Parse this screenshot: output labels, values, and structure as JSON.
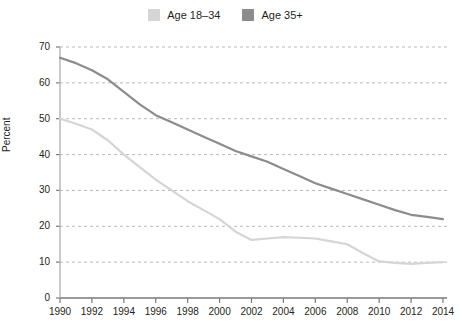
{
  "chart_data": {
    "type": "line",
    "title": "",
    "subtitle": "",
    "xlabel": "",
    "ylabel": "Percent",
    "xlim": [
      1990,
      2014
    ],
    "ylim": [
      0,
      70
    ],
    "grid": "horizontal-dashed",
    "legend_position": "top-center",
    "x": [
      1990,
      1991,
      1992,
      1993,
      1994,
      1995,
      1996,
      1997,
      1998,
      1999,
      2000,
      2001,
      2002,
      2003,
      2004,
      2005,
      2006,
      2007,
      2008,
      2009,
      2010,
      2011,
      2012,
      2013,
      2014
    ],
    "xticks": [
      1990,
      1992,
      1994,
      1996,
      1998,
      2000,
      2002,
      2004,
      2006,
      2008,
      2010,
      2012,
      2014
    ],
    "xtick_labels": [
      "1990",
      "1992",
      "1994",
      "1996",
      "1998",
      "2000",
      "2002",
      "2004",
      "2006",
      "2008",
      "2010",
      "2012",
      "2014"
    ],
    "yticks": [
      0,
      10,
      20,
      30,
      40,
      50,
      60,
      70
    ],
    "ytick_labels": [
      "0",
      "10",
      "20",
      "30",
      "40",
      "50",
      "60",
      "70"
    ],
    "series": [
      {
        "name": "Age 18–34",
        "color": "#d5d5d5",
        "values": [
          50.0,
          48.6,
          47.0,
          44.0,
          40.0,
          36.5,
          33.0,
          30.0,
          27.0,
          24.5,
          22.0,
          18.5,
          16.2,
          16.6,
          17.0,
          16.8,
          16.6,
          15.8,
          15.0,
          12.5,
          10.2,
          9.8,
          9.5,
          9.8,
          10.0
        ]
      },
      {
        "name": "Age 35+",
        "color": "#8c8c8c",
        "values": [
          67.0,
          65.5,
          63.5,
          61.0,
          57.5,
          54.0,
          51.0,
          49.0,
          47.0,
          45.0,
          43.0,
          41.0,
          39.5,
          38.0,
          36.0,
          34.0,
          32.0,
          30.5,
          29.0,
          27.5,
          26.0,
          24.5,
          23.2,
          22.6,
          22.0
        ]
      }
    ]
  },
  "legend": {
    "items": [
      {
        "label": "Age 18–34",
        "color": "#d5d5d5"
      },
      {
        "label": "Age 35+",
        "color": "#8c8c8c"
      }
    ]
  },
  "axes": {
    "y_axis_label": "Percent"
  }
}
